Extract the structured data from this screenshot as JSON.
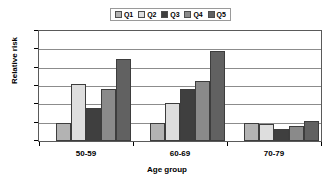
{
  "chart_data": {
    "type": "bar",
    "title": "",
    "xlabel": "Age group",
    "ylabel": "Relative risk",
    "categories": [
      "50-59",
      "60-69",
      "70-79"
    ],
    "ylim": [
      0,
      6
    ],
    "yticks": [
      0,
      1,
      2,
      3,
      4,
      5,
      6
    ],
    "ytick_labels": [
      "0",
      "1",
      "2",
      "3",
      "4",
      "5",
      "6"
    ],
    "grid": true,
    "legend_position": "top-center",
    "series": [
      {
        "name": "Q1",
        "color": "#b3b3b3",
        "values": [
          1.0,
          1.0,
          1.0
        ]
      },
      {
        "name": "Q2",
        "color": "#dedede",
        "values": [
          3.1,
          2.1,
          0.95
        ]
      },
      {
        "name": "Q3",
        "color": "#3f3f3f",
        "values": [
          1.8,
          2.85,
          0.65
        ]
      },
      {
        "name": "Q4",
        "color": "#8a8a8a",
        "values": [
          2.85,
          3.25,
          0.82
        ]
      },
      {
        "name": "Q5",
        "color": "#616161",
        "values": [
          4.45,
          4.9,
          1.07
        ]
      }
    ]
  },
  "legend": {
    "entries": [
      {
        "label": "Q1"
      },
      {
        "label": "Q2"
      },
      {
        "label": "Q3"
      },
      {
        "label": "Q4"
      },
      {
        "label": "Q5"
      }
    ]
  },
  "axes": {
    "y_title": "Relative risk",
    "x_title": "Age group",
    "y_tick_labels": [
      "0",
      "1",
      "2",
      "3",
      "4",
      "5",
      "6"
    ],
    "x_tick_labels": [
      "50-59",
      "60-69",
      "70-79"
    ]
  }
}
